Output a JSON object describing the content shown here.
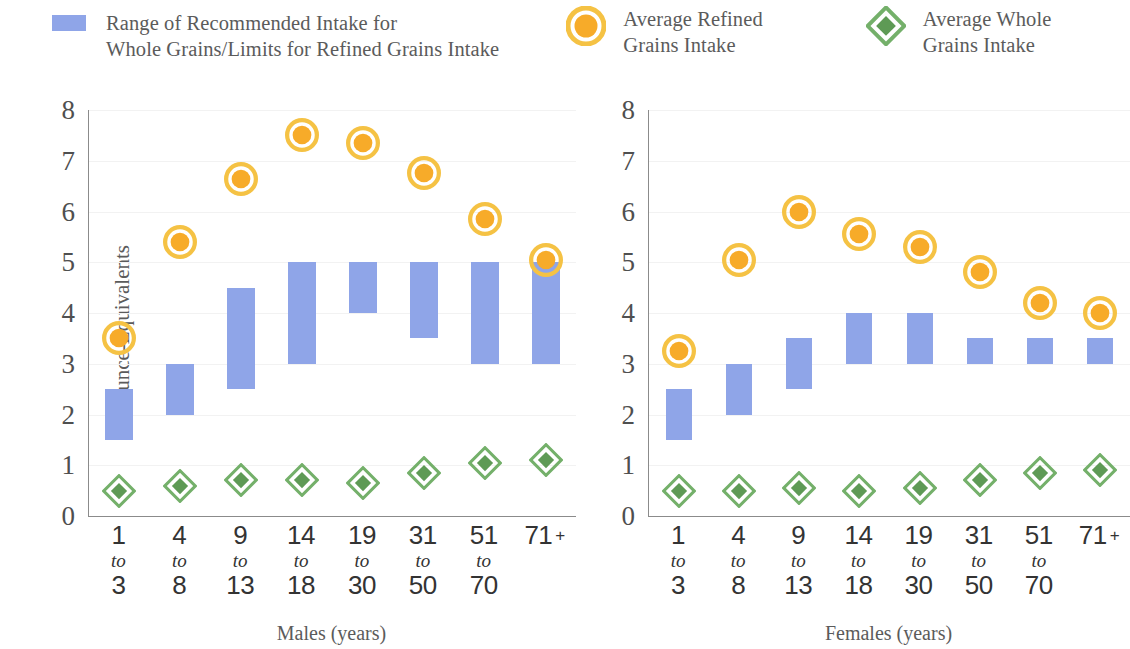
{
  "legend": {
    "items": [
      {
        "icon": "blue-bar-swatch",
        "label": "Range of Recommended Intake for\nWhole Grains/Limits for Refined Grains Intake",
        "color": "#8fa5e8"
      },
      {
        "icon": "orange-circle-swatch",
        "label": "Average Refined\nGrains Intake",
        "color": "#f5a623"
      },
      {
        "icon": "green-diamond-swatch",
        "label": "Average Whole\nGrains Intake",
        "color": "#6aa860"
      }
    ]
  },
  "chart_data": {
    "type": "bar",
    "title": "",
    "ylabel": "Ounce-Equivalents",
    "ylim": [
      0,
      8
    ],
    "yticks": [
      "0",
      "1",
      "2",
      "3",
      "4",
      "5",
      "6",
      "7",
      "8"
    ],
    "grid": true,
    "legend_position": "top",
    "panels": [
      {
        "name": "males",
        "xlabel": "Males (years)",
        "categories": [
          {
            "start": "1",
            "to": "to",
            "end": "3",
            "plus": ""
          },
          {
            "start": "4",
            "to": "to",
            "end": "8",
            "plus": ""
          },
          {
            "start": "9",
            "to": "to",
            "end": "13",
            "plus": ""
          },
          {
            "start": "14",
            "to": "to",
            "end": "18",
            "plus": ""
          },
          {
            "start": "19",
            "to": "to",
            "end": "30",
            "plus": ""
          },
          {
            "start": "31",
            "to": "to",
            "end": "50",
            "plus": ""
          },
          {
            "start": "51",
            "to": "to",
            "end": "70",
            "plus": ""
          },
          {
            "start": "71",
            "to": "",
            "end": "",
            "plus": "+"
          }
        ],
        "series": [
          {
            "name": "Range of Recommended Intake for Whole Grains/Limits for Refined Grains Intake",
            "type": "range-bar",
            "low": [
              1.5,
              2.0,
              2.5,
              3.0,
              4.0,
              3.5,
              3.0,
              3.0
            ],
            "high": [
              2.5,
              3.0,
              4.5,
              5.0,
              5.0,
              5.0,
              5.0,
              5.0
            ]
          },
          {
            "name": "Average Refined Grains Intake",
            "type": "circle-marker",
            "values": [
              3.5,
              5.4,
              6.65,
              7.5,
              7.35,
              6.75,
              5.85,
              5.05
            ]
          },
          {
            "name": "Average Whole Grains Intake",
            "type": "diamond-marker",
            "values": [
              0.5,
              0.6,
              0.7,
              0.7,
              0.65,
              0.85,
              1.05,
              1.1
            ]
          }
        ]
      },
      {
        "name": "females",
        "xlabel": "Females (years)",
        "categories": [
          {
            "start": "1",
            "to": "to",
            "end": "3",
            "plus": ""
          },
          {
            "start": "4",
            "to": "to",
            "end": "8",
            "plus": ""
          },
          {
            "start": "9",
            "to": "to",
            "end": "13",
            "plus": ""
          },
          {
            "start": "14",
            "to": "to",
            "end": "18",
            "plus": ""
          },
          {
            "start": "19",
            "to": "to",
            "end": "30",
            "plus": ""
          },
          {
            "start": "31",
            "to": "to",
            "end": "50",
            "plus": ""
          },
          {
            "start": "51",
            "to": "to",
            "end": "70",
            "plus": ""
          },
          {
            "start": "71",
            "to": "",
            "end": "",
            "plus": "+"
          }
        ],
        "series": [
          {
            "name": "Range of Recommended Intake for Whole Grains/Limits for Refined Grains Intake",
            "type": "range-bar",
            "low": [
              1.5,
              2.0,
              2.5,
              3.0,
              3.0,
              3.0,
              3.0,
              3.0
            ],
            "high": [
              2.5,
              3.0,
              3.5,
              4.0,
              4.0,
              3.5,
              3.5,
              3.5
            ]
          },
          {
            "name": "Average Refined Grains Intake",
            "type": "circle-marker",
            "values": [
              3.25,
              5.05,
              6.0,
              5.55,
              5.3,
              4.8,
              4.2,
              4.0
            ]
          },
          {
            "name": "Average Whole Grains Intake",
            "type": "diamond-marker",
            "values": [
              0.5,
              0.5,
              0.55,
              0.5,
              0.55,
              0.7,
              0.85,
              0.9
            ]
          }
        ]
      }
    ]
  }
}
